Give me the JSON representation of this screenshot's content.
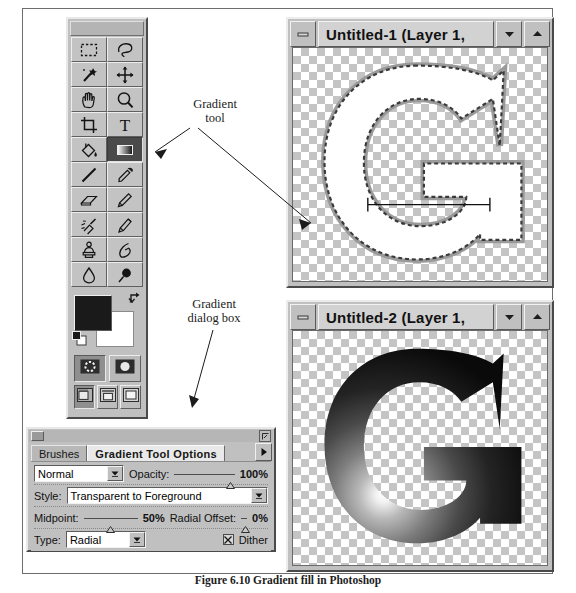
{
  "figure": {
    "caption": "Figure 6.10  Gradient fill in Photoshop"
  },
  "callouts": [
    {
      "id": "gradient-tool",
      "line1": "Gradient",
      "line2": "tool"
    },
    {
      "id": "gradient-dialog",
      "line1": "Gradient",
      "line2": "dialog box"
    }
  ],
  "toolbox": {
    "title": "",
    "tools": [
      {
        "name": "marquee-tool",
        "icon": "marquee",
        "selected": false
      },
      {
        "name": "lasso-tool",
        "icon": "lasso",
        "selected": false
      },
      {
        "name": "magic-wand-tool",
        "icon": "magic-wand",
        "selected": false
      },
      {
        "name": "move-tool",
        "icon": "move",
        "selected": false
      },
      {
        "name": "hand-tool",
        "icon": "hand",
        "selected": false
      },
      {
        "name": "zoom-tool",
        "icon": "magnifier",
        "selected": false
      },
      {
        "name": "crop-tool",
        "icon": "crop",
        "selected": false
      },
      {
        "name": "type-tool",
        "icon": "type",
        "selected": false
      },
      {
        "name": "paint-bucket-tool",
        "icon": "paint-bucket",
        "selected": false
      },
      {
        "name": "gradient-tool",
        "icon": "gradient",
        "selected": true
      },
      {
        "name": "line-tool",
        "icon": "line",
        "selected": false
      },
      {
        "name": "eyedropper-tool",
        "icon": "eyedropper",
        "selected": false
      },
      {
        "name": "eraser-tool",
        "icon": "eraser",
        "selected": false
      },
      {
        "name": "pencil-tool",
        "icon": "pencil",
        "selected": false
      },
      {
        "name": "airbrush-tool",
        "icon": "airbrush",
        "selected": false
      },
      {
        "name": "paintbrush-tool",
        "icon": "paintbrush",
        "selected": false
      },
      {
        "name": "rubber-stamp-tool",
        "icon": "rubber-stamp",
        "selected": false
      },
      {
        "name": "smudge-tool",
        "icon": "smudge",
        "selected": false
      },
      {
        "name": "blur-tool",
        "icon": "waterdrop",
        "selected": false
      },
      {
        "name": "dodge-burn-tool",
        "icon": "dodge-burn",
        "selected": false
      }
    ],
    "colors": {
      "foreground": "#1a1a1a",
      "background": "#ffffff",
      "swap_icon": "swap-colors-icon",
      "default_icon": "default-colors-icon"
    },
    "mask_modes": [
      {
        "name": "standard-mode",
        "icon": "standard-mask-icon",
        "selected": true
      },
      {
        "name": "quick-mask-mode",
        "icon": "quick-mask-icon",
        "selected": false
      }
    ],
    "screen_modes": [
      {
        "name": "standard-screen-mode",
        "icon": "screen-standard-icon",
        "selected": true
      },
      {
        "name": "full-screen-menubar",
        "icon": "screen-fullmenu-icon",
        "selected": false
      },
      {
        "name": "full-screen-mode",
        "icon": "screen-full-icon",
        "selected": false
      }
    ]
  },
  "windows": [
    {
      "id": "untitled-1",
      "title": "Untitled-1  (Layer 1,",
      "minimize_label": "–",
      "dropdown_icon": "chevron-down-icon",
      "restore_icon": "chevron-up-icon",
      "canvas": "letter-G-selection-with-gradient-drag-line"
    },
    {
      "id": "untitled-2",
      "title": "Untitled-2  (Layer 1,",
      "minimize_label": "–",
      "dropdown_icon": "chevron-down-icon",
      "restore_icon": "chevron-up-icon",
      "canvas": "letter-G-filled-radial-gradient"
    }
  ],
  "dialog": {
    "close_icon": "close-box-icon",
    "menu_icon": "palette-menu-icon",
    "tabs": [
      {
        "label": "Brushes",
        "active": false
      },
      {
        "label": "Gradient Tool Options",
        "active": true
      }
    ],
    "tab_arrow_icon": "triangle-right-icon",
    "blend_mode": {
      "value": "Normal",
      "arrow_icon": "dropdown-arrow-icon"
    },
    "opacity": {
      "label": "Opacity:",
      "value": "100%",
      "slider_percent": 100
    },
    "style": {
      "label": "Style:",
      "value": "Transparent to Foreground",
      "arrow_icon": "dropdown-arrow-icon"
    },
    "midpoint": {
      "label": "Midpoint:",
      "value": "50%",
      "slider_percent": 50
    },
    "radial_offset": {
      "label": "Radial Offset:",
      "value": "0%",
      "slider_percent": 0
    },
    "type": {
      "label": "Type:",
      "value": "Radial",
      "arrow_icon": "dropdown-arrow-icon"
    },
    "dither": {
      "label": "Dither",
      "checked": true
    }
  }
}
